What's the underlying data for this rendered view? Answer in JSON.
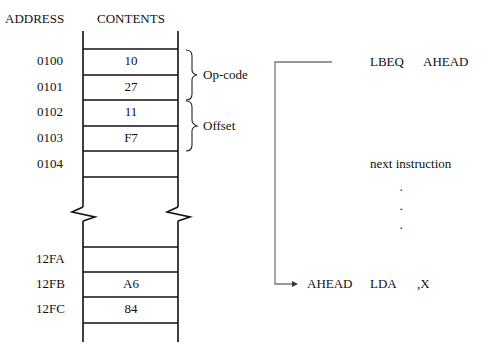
{
  "headers": {
    "address": "ADDRESS",
    "contents": "CONTENTS"
  },
  "memory_top": [
    {
      "address": "0100",
      "contents": "10"
    },
    {
      "address": "0101",
      "contents": "27"
    },
    {
      "address": "0102",
      "contents": "11"
    },
    {
      "address": "0103",
      "contents": "F7"
    },
    {
      "address": "0104",
      "contents": ""
    }
  ],
  "memory_bottom": [
    {
      "address": "12FA",
      "contents": ""
    },
    {
      "address": "12FB",
      "contents": "A6"
    },
    {
      "address": "12FC",
      "contents": "84"
    }
  ],
  "braces": {
    "opcode": "Op-code",
    "offset": "Offset"
  },
  "program": {
    "branch": {
      "mnemonic": "LBEQ",
      "operand": "AHEAD"
    },
    "next": "next instruction",
    "ellipsis": [
      "·",
      "·",
      "·"
    ],
    "target": {
      "label": "AHEAD",
      "mnemonic": "LDA",
      "operand": ",X"
    }
  }
}
